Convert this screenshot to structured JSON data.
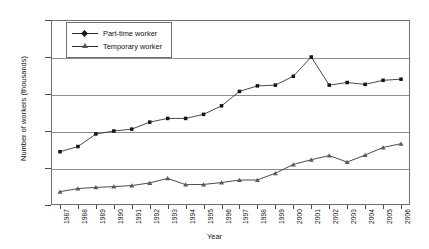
{
  "chart_data": {
    "type": "line",
    "title": "",
    "xlabel": "Year",
    "ylabel": "Number of workers (thousands)",
    "categories": [
      "1987",
      "1988",
      "1989",
      "1990",
      "1991",
      "1992",
      "1993",
      "1994",
      "1995",
      "1996",
      "1997",
      "1998",
      "1999",
      "2000",
      "2001",
      "2002",
      "2003",
      "2004",
      "2005",
      "2006"
    ],
    "ylim": [
      0,
      2500
    ],
    "yticks": [
      0,
      500,
      1000,
      1500,
      2000,
      2500
    ],
    "grid": true,
    "legend_position": "top-left-inside",
    "series": [
      {
        "name": "Part-time worker",
        "marker": "diamond",
        "values": [
          720,
          790,
          960,
          1000,
          1025,
          1120,
          1170,
          1170,
          1225,
          1340,
          1535,
          1610,
          1620,
          1740,
          2000,
          1620,
          1655,
          1630,
          1685,
          1700
        ]
      },
      {
        "name": "Temporary worker",
        "marker": "triangle",
        "values": [
          180,
          222,
          238,
          248,
          263,
          298,
          360,
          275,
          278,
          303,
          337,
          338,
          430,
          548,
          612,
          668,
          580,
          675,
          778,
          828
        ]
      }
    ]
  },
  "axis": {
    "y_title": "Number of workers (thousands)",
    "x_title": "Year"
  },
  "legend": {
    "items": [
      {
        "label": "Part-time worker",
        "marker": "diamond-marker"
      },
      {
        "label": "Temporary worker",
        "marker": "triangle-marker"
      }
    ]
  },
  "colors": {
    "line": "#2a2a2a",
    "grid": "#8d8d8d",
    "frame": "#6f6f6f",
    "text": "#111111",
    "background": "#ffffff"
  }
}
